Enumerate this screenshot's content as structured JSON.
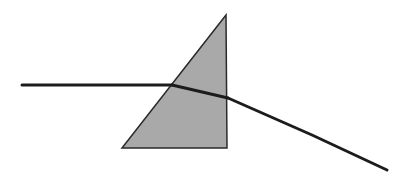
{
  "diagram": {
    "type": "prism-refraction",
    "colors": {
      "background": "#ffffff",
      "prism_fill": "#a9a9a9",
      "prism_stroke": "#2a2a2a",
      "ray": "#1c1c1c"
    },
    "prism": {
      "shape": "right-triangle",
      "points": [
        [
          226,
          15
        ],
        [
          122,
          148
        ],
        [
          227,
          148
        ]
      ]
    },
    "rays": {
      "incident": [
        [
          22,
          85
        ],
        [
          172,
          85
        ]
      ],
      "refracted_inside": [
        [
          172,
          85
        ],
        [
          228,
          98
        ]
      ],
      "emergent": [
        [
          228,
          98
        ],
        [
          312,
          135
        ],
        [
          387,
          170
        ]
      ]
    }
  }
}
